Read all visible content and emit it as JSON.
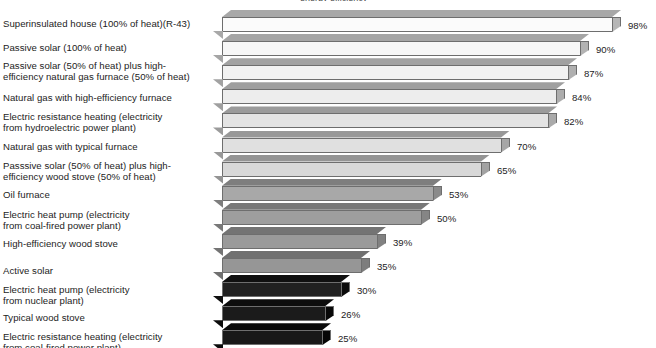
{
  "chart_title": "energy efficiency",
  "chart_data": {
    "type": "bar",
    "orientation": "horizontal",
    "title": "energy efficiency",
    "xlabel": "",
    "ylabel": "",
    "xlim": [
      0,
      100
    ],
    "grid": false,
    "legend": "none",
    "value_suffix": "%",
    "categories": [
      "Superinsulated house (100% of heat)(R-43)",
      "Passive solar (100% of heat)",
      "Passive solar (50% of heat) plus high-\nefficiency natural gas furnace (50% of heat)",
      "Natural gas with high-efficiency furnace",
      "Electric resistance heating (electricity\nfrom hydroelectric power plant)",
      "Natural gas with typical furnace",
      "Passsive solar (50% of heat) plus high-\nefficiency wood stove (50% of heat)",
      "Oil furnace",
      "Electric heat pump (electricity\nfrom coal-fired power plant)",
      "High-efficiency wood stove",
      "Active solar",
      "Electric heat pump (electricity\nfrom nuclear plant)",
      "Typical wood stove",
      "Electric resistance heating (electricity\nfrom coal-fired power plant)"
    ],
    "values": [
      98,
      90,
      87,
      84,
      82,
      70,
      65,
      53,
      50,
      39,
      35,
      30,
      26,
      25
    ],
    "value_labels": [
      "98%",
      "90%",
      "87%",
      "84%",
      "82%",
      "70%",
      "65%",
      "53%",
      "50%",
      "39%",
      "35%",
      "30%",
      "26%",
      "25%"
    ],
    "bar_colors": [
      "#fbfbfb",
      "#f7f7f7",
      "#f2f2f2",
      "#ededed",
      "#e4e4e4",
      "#e0e0e0",
      "#d8d8d8",
      "#a8a8a8",
      "#9e9e9e",
      "#9a9a9a",
      "#969696",
      "#212121",
      "#1b1b1b",
      "#181818"
    ],
    "bar_top_colors": [
      "#a8a8a8",
      "#a5a5a5",
      "#a2a2a2",
      "#9f9f9f",
      "#9b9b9b",
      "#989898",
      "#949494",
      "#7e7e7e",
      "#787878",
      "#747474",
      "#707070",
      "#101010",
      "#0d0d0d",
      "#0b0b0b"
    ],
    "bar_side_colors": [
      "#b6b6b6",
      "#b3b3b3",
      "#b0b0b0",
      "#adadad",
      "#aaaaaa",
      "#a6a6a6",
      "#a2a2a2",
      "#8a8a8a",
      "#858585",
      "#818181",
      "#7d7d7d",
      "#0a0a0a",
      "#080808",
      "#060606"
    ]
  }
}
